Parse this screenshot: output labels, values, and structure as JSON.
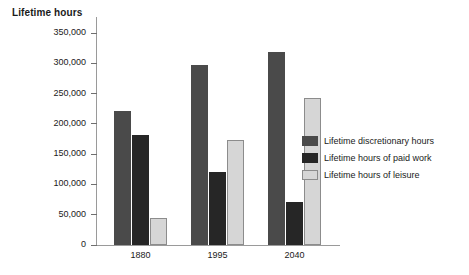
{
  "chart_data": {
    "type": "bar",
    "title": "Lifetime hours",
    "xlabel": "",
    "ylabel": "Lifetime hours",
    "categories": [
      "1880",
      "1995",
      "2040"
    ],
    "series": [
      {
        "name": "Lifetime discretionary hours",
        "color": "#4a4a4a",
        "values": [
          222000,
          297000,
          318000
        ]
      },
      {
        "name": "Lifetime hours of paid work",
        "color": "#262626",
        "values": [
          182000,
          120000,
          71000
        ]
      },
      {
        "name": "Lifetime hours of leisure",
        "color": "#d6d6d6",
        "values": [
          45000,
          173000,
          242000
        ]
      }
    ],
    "ylim": [
      0,
      350000
    ],
    "ytick_values": [
      0,
      50000,
      100000,
      150000,
      200000,
      250000,
      300000,
      350000
    ],
    "ytick_labels": [
      "0",
      "50,000",
      "100,000",
      "150,000",
      "200,000",
      "250,000",
      "300,000",
      "350,000"
    ],
    "grid": false,
    "legend_position": "right"
  }
}
